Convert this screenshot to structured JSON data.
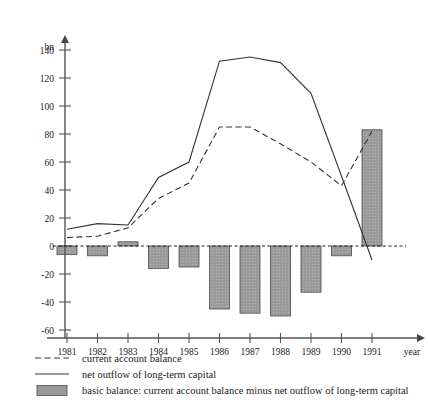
{
  "chart_data": {
    "type": "line",
    "title": "",
    "xlabel": "year",
    "ylabel": "bn",
    "categories": [
      "1981",
      "1982",
      "1983",
      "1984",
      "1985",
      "1986",
      "1987",
      "1988",
      "1989",
      "1990",
      "1991"
    ],
    "x": [
      1981,
      1982,
      1983,
      1984,
      1985,
      1986,
      1987,
      1988,
      1989,
      1990,
      1991
    ],
    "ylim": [
      -60,
      150
    ],
    "xlim": [
      1980.6,
      1991.8
    ],
    "yticks": [
      -60,
      -40,
      -20,
      0,
      20,
      40,
      60,
      80,
      100,
      120,
      140
    ],
    "ytick_labels": [
      "-60",
      "-40",
      "-20",
      "0",
      "20",
      "40",
      "60",
      "80",
      "100",
      "120",
      "140"
    ],
    "grid": false,
    "legend_position": "below",
    "zero_line": true,
    "series": [
      {
        "name": "current account balance",
        "type": "line",
        "style": "dashed",
        "color": "#333333",
        "values": [
          6,
          7,
          13,
          34,
          45,
          85,
          85,
          73,
          60,
          43,
          82
        ]
      },
      {
        "name": "net outflow of long-term capital",
        "type": "line",
        "style": "solid",
        "color": "#333333",
        "values": [
          12,
          16,
          15,
          49,
          60,
          132,
          135,
          131,
          109,
          50,
          -10
        ]
      },
      {
        "name": "basic balance: current account balance minus net outflow of long-term capital",
        "type": "bar",
        "style": "filled",
        "color": "#9a9a9a",
        "values": [
          -6,
          -7,
          3,
          -16,
          -15,
          -45,
          -48,
          -50,
          -33,
          -7,
          83
        ]
      }
    ]
  },
  "axis": {
    "y_unit_label": "bn",
    "x_unit_label": "year"
  },
  "legend": {
    "items": [
      {
        "marker": "dashed-line-swatch",
        "label": "current account balance"
      },
      {
        "marker": "solid-line-swatch",
        "label": "net outflow of long-term capital"
      },
      {
        "marker": "filled-box-swatch",
        "label": "basic balance: current account balance minus net outflow of long-term capital"
      }
    ]
  },
  "colors": {
    "axis": "#555555",
    "line": "#333333",
    "bar_fill": "#9a9a9a",
    "bar_stroke": "#4a4a4a",
    "text": "#1a1a1a"
  }
}
